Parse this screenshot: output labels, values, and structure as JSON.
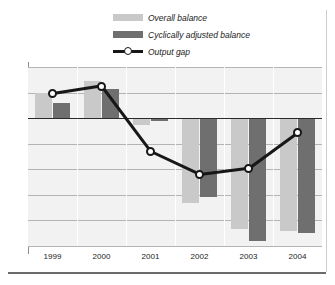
{
  "legend": {
    "items": [
      {
        "label": "Overall balance",
        "swatch": "light-gray-bar",
        "color": "#c9c9c9"
      },
      {
        "label": "Cyclically adjusted balance",
        "swatch": "dark-gray-bar",
        "color": "#6f6f6f"
      },
      {
        "label": "Output gap",
        "swatch": "line-with-circle-marker",
        "color": "#171717"
      }
    ]
  },
  "chart_data": {
    "type": "bar",
    "title": "",
    "xlabel": "",
    "ylabel": "",
    "categories": [
      "1999",
      "2000",
      "2001",
      "2002",
      "2003",
      "2004"
    ],
    "ylim": [
      -5,
      2
    ],
    "yticks": [
      "2",
      "1",
      "0",
      "-1",
      "-2",
      "-3",
      "-4",
      "-5"
    ],
    "ytick_values": [
      2,
      1,
      0,
      -1,
      -2,
      -3,
      -4,
      -5
    ],
    "grid": true,
    "legend_position": "top-center",
    "series": [
      {
        "name": "Overall balance",
        "type": "bar",
        "color": "#c9c9c9",
        "values": [
          1.0,
          1.45,
          -0.25,
          -3.3,
          -4.35,
          -4.4
        ]
      },
      {
        "name": "Cyclically adjusted balance",
        "type": "bar",
        "color": "#6f6f6f",
        "values": [
          0.6,
          1.15,
          -0.1,
          -3.1,
          -4.8,
          -4.5
        ]
      },
      {
        "name": "Output gap",
        "type": "line",
        "color": "#171717",
        "marker": "circle",
        "values": [
          0.95,
          1.25,
          -1.3,
          -2.2,
          -1.95,
          -0.55
        ]
      }
    ]
  }
}
